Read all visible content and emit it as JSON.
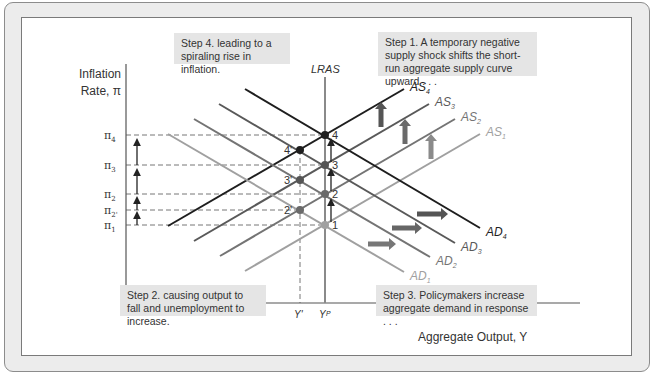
{
  "diagram": {
    "y_axis_label_line1": "Inflation",
    "y_axis_label_line2": "Rate, π",
    "x_axis_label": "Aggregate Output, Y",
    "lras_label": "LRAS",
    "x_ticks": [
      {
        "label": "Y'",
        "x": 300
      },
      {
        "label": "Yᴾ",
        "x": 325
      }
    ],
    "y_ticks": [
      {
        "label": "π",
        "sub": "4",
        "y": 135
      },
      {
        "label": "π",
        "sub": "3",
        "y": 165
      },
      {
        "label": "π",
        "sub": "2",
        "y": 194
      },
      {
        "label": "π",
        "sub": "2'",
        "y": 210
      },
      {
        "label": "π",
        "sub": "1",
        "y": 225
      }
    ],
    "as_curves": [
      {
        "name": "AS",
        "sub": "1",
        "color": "#a0a0a0",
        "x1": 245,
        "y1": 271,
        "x2": 480,
        "y2": 134
      },
      {
        "name": "AS",
        "sub": "2",
        "color": "#747474",
        "x1": 220,
        "y1": 256,
        "x2": 455,
        "y2": 119
      },
      {
        "name": "AS",
        "sub": "3",
        "color": "#595959",
        "x1": 194,
        "y1": 241,
        "x2": 429,
        "y2": 104
      },
      {
        "name": "AS",
        "sub": "4",
        "color": "#1e1e1e",
        "x1": 168,
        "y1": 226,
        "x2": 404,
        "y2": 89
      }
    ],
    "ad_curves": [
      {
        "name": "AD",
        "sub": "1",
        "color": "#a0a0a0",
        "x1": 168,
        "y1": 134,
        "x2": 404,
        "y2": 272
      },
      {
        "name": "AD",
        "sub": "2",
        "color": "#747474",
        "x1": 194,
        "y1": 119,
        "x2": 430,
        "y2": 257
      },
      {
        "name": "AD",
        "sub": "3",
        "color": "#595959",
        "x1": 219,
        "y1": 104,
        "x2": 455,
        "y2": 243
      },
      {
        "name": "AD",
        "sub": "4",
        "color": "#1e1e1e",
        "x1": 245,
        "y1": 89,
        "x2": 480,
        "y2": 228
      }
    ],
    "points": [
      {
        "label": "1",
        "x": 325,
        "y": 225,
        "color": "#a0a0a0"
      },
      {
        "label": "2'",
        "x": 300,
        "y": 210,
        "color": "#6a6a6a"
      },
      {
        "label": "2",
        "x": 325,
        "y": 194,
        "color": "#6a6a6a"
      },
      {
        "label": "3'",
        "x": 300,
        "y": 180,
        "color": "#555555"
      },
      {
        "label": "3",
        "x": 325,
        "y": 165,
        "color": "#555555"
      },
      {
        "label": "4'",
        "x": 300,
        "y": 150,
        "color": "#1e1e1e"
      },
      {
        "label": "4",
        "x": 325,
        "y": 135,
        "color": "#1e1e1e"
      }
    ],
    "steps": {
      "step1": "Step 1. A temporary negative supply shock shifts the short-run aggregate supply curve upward . . .",
      "step2": "Step 2. causing output to fall and unemployment to increase.",
      "step3": "Step 3. Policymakers increase aggregate demand in response . . .",
      "step4": "Step 4. leading to a spiraling rise in inflation."
    },
    "colors": {
      "frame_bg": "#ececec",
      "box_bg": "#e5e5e5",
      "axis": "#555555",
      "shift_arrow_up": "#6a6a6a",
      "shift_arrow_right": "#5a5a5a"
    }
  }
}
